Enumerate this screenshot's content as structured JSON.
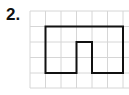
{
  "problem": {
    "number_label": "2."
  },
  "grid": {
    "columns": 6,
    "rows": 5,
    "cell_size_px": 15.5,
    "origin_x": 30,
    "origin_y": 11,
    "line_color": "#d6d6d6",
    "extends_right_to_edge": true
  },
  "shape": {
    "description": "Rectilinear outline of a rectangle with a one-cell notch cut up from the bottom edge",
    "stroke_color": "#111111",
    "stroke_width": 2,
    "vertices_grid_units": [
      [
        1,
        1
      ],
      [
        6,
        1
      ],
      [
        6,
        4
      ],
      [
        4,
        4
      ],
      [
        4,
        2
      ],
      [
        3,
        2
      ],
      [
        3,
        4
      ],
      [
        1,
        4
      ]
    ]
  }
}
